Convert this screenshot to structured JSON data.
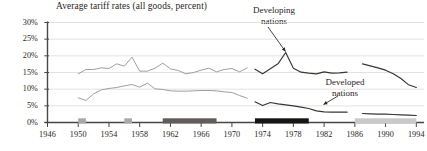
{
  "chart_data": {
    "type": "line",
    "title": "Average tariff rates (all goods, percent)",
    "xlabel": "",
    "ylabel": "",
    "xlim": [
      1946,
      1995
    ],
    "ylim": [
      0,
      30
    ],
    "grid": true,
    "legend_position": "inline-annotations",
    "y_ticks": [
      0,
      5,
      10,
      15,
      20,
      25,
      30
    ],
    "y_tick_labels": [
      "0%",
      "5%",
      "10%",
      "15%",
      "20%",
      "25%",
      "30%"
    ],
    "x_ticks": [
      1946,
      1950,
      1954,
      1958,
      1962,
      1966,
      1970,
      1974,
      1978,
      1982,
      1986,
      1990,
      1994
    ],
    "x_tick_labels": [
      "1946",
      "1950",
      "1954",
      "1958",
      "1962",
      "1966",
      "1970",
      "1974",
      "1978",
      "1982",
      "1986",
      "1990",
      "1994"
    ],
    "annotations": [
      {
        "id": "developing",
        "text_line1": "Developing",
        "text_line2": "nations",
        "points_to_year": 1977,
        "points_to_value": 21.0
      },
      {
        "id": "developed",
        "text_line1": "Developed",
        "text_line2": "nations",
        "points_to_year": 1984,
        "points_to_value": 3.2
      }
    ],
    "series": [
      {
        "name": "Developing nations",
        "color": "#9a9a9a",
        "segment": "1950-1972",
        "x": [
          1950,
          1951,
          1952,
          1953,
          1954,
          1955,
          1956,
          1957,
          1958,
          1959,
          1960,
          1961,
          1962,
          1963,
          1964,
          1965,
          1966,
          1967,
          1968,
          1969,
          1970,
          1971,
          1972
        ],
        "values": [
          14.6,
          15.9,
          15.9,
          16.4,
          16.2,
          17.6,
          16.9,
          19.6,
          15.4,
          15.4,
          16.3,
          17.8,
          16.1,
          15.6,
          14.6,
          15.0,
          15.7,
          16.3,
          15.2,
          15.9,
          16.2,
          15.2,
          16.4
        ]
      },
      {
        "name": "Developing nations",
        "color": "#3a3634",
        "segment": "1973-1985",
        "x": [
          1973,
          1974,
          1975,
          1976,
          1977,
          1978,
          1979,
          1980,
          1981,
          1982,
          1983,
          1984,
          1985
        ],
        "values": [
          16.0,
          14.6,
          16.1,
          17.6,
          21.0,
          16.3,
          15.1,
          14.8,
          14.6,
          15.2,
          14.8,
          14.9,
          15.1
        ]
      },
      {
        "name": "Developing nations",
        "color": "#3a3634",
        "segment": "1987-1994",
        "x": [
          1987,
          1988,
          1989,
          1990,
          1991,
          1992,
          1993,
          1994
        ],
        "values": [
          17.6,
          17.0,
          16.4,
          15.7,
          14.6,
          13.2,
          11.3,
          10.5
        ]
      },
      {
        "name": "Developed nations",
        "color": "#9a9a9a",
        "segment": "1950-1972",
        "x": [
          1950,
          1951,
          1952,
          1953,
          1954,
          1955,
          1956,
          1957,
          1958,
          1959,
          1960,
          1961,
          1962,
          1963,
          1964,
          1965,
          1966,
          1967,
          1968,
          1969,
          1970,
          1971,
          1972
        ],
        "values": [
          7.4,
          6.6,
          8.6,
          9.8,
          10.2,
          10.5,
          11.0,
          11.4,
          10.6,
          11.8,
          10.1,
          9.9,
          9.5,
          9.4,
          9.4,
          9.5,
          9.6,
          9.6,
          9.5,
          9.2,
          9.0,
          8.1,
          7.3
        ]
      },
      {
        "name": "Developed nations",
        "color": "#3a3634",
        "segment": "1973-1985",
        "x": [
          1973,
          1974,
          1975,
          1976,
          1977,
          1978,
          1979,
          1980,
          1981,
          1982,
          1983,
          1984,
          1985
        ],
        "values": [
          6.2,
          5.1,
          6.0,
          5.6,
          5.3,
          5.0,
          4.6,
          4.2,
          3.5,
          3.2,
          3.1,
          3.1,
          3.1
        ]
      },
      {
        "name": "Developed nations",
        "color": "#3a3634",
        "segment": "1987-1994",
        "x": [
          1987,
          1988,
          1989,
          1990,
          1991,
          1992,
          1993,
          1994
        ],
        "values": [
          2.7,
          2.6,
          2.5,
          2.5,
          2.4,
          2.3,
          2.2,
          2.1
        ]
      }
    ],
    "round_bars": [
      {
        "name": "round-bar-1",
        "start_year": 1950,
        "end_year": 1951,
        "shade": "#a8a8a8"
      },
      {
        "name": "round-bar-2",
        "start_year": 1956,
        "end_year": 1957,
        "shade": "#a8a8a8"
      },
      {
        "name": "round-bar-3",
        "start_year": 1961,
        "end_year": 1968,
        "shade": "#5f5c5a"
      },
      {
        "name": "round-bar-4",
        "start_year": 1973,
        "end_year": 1980,
        "shade": "#161514"
      },
      {
        "name": "round-bar-5",
        "start_year": 1986,
        "end_year": 1994,
        "shade": "#c9c9c9"
      }
    ]
  }
}
